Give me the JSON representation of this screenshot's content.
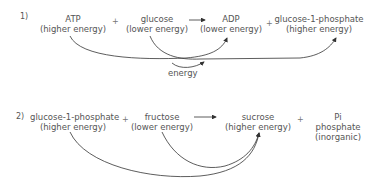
{
  "reaction1": {
    "number": "1)",
    "reactant1": {
      "name": "ATP",
      "energy": "(higher energy)"
    },
    "plus1": "+",
    "reactant2": {
      "name": "glucose",
      "energy": "(lower energy)"
    },
    "product1": {
      "name": "ADP",
      "energy": "(lower energy)"
    },
    "plus2": "+",
    "product2": {
      "name": "glucose-1-phosphate",
      "energy": "(higher energy)"
    },
    "energy_label": "energy"
  },
  "reaction2": {
    "number": "2)",
    "reactant1": {
      "name": "glucose-1-phosphate",
      "energy": "(higher energy)"
    },
    "plus1": "+",
    "reactant2": {
      "name": "fructose",
      "energy": "(lower energy)"
    },
    "product1": {
      "name": "sucrose",
      "energy": "(higher energy)"
    },
    "plus2": "+",
    "product2": {
      "name": "Pi",
      "line2": "phosphate",
      "line3": "(inorganic)"
    }
  }
}
